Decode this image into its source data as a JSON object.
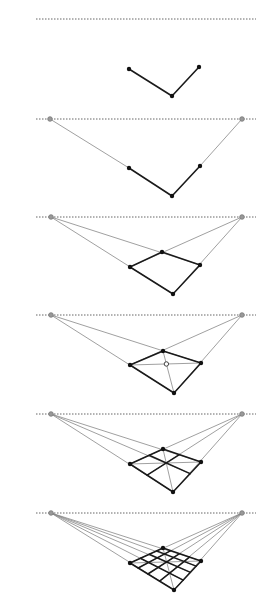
{
  "colors": {
    "horizon": "#666666",
    "vp_fill": "#999999",
    "vp_stroke": "#777777",
    "construction": "#888888",
    "edge": "#1a1a1a",
    "point": "#111111"
  },
  "panels": [
    {
      "step": 1,
      "horizon_y": 19,
      "horizon_x": [
        36,
        256
      ],
      "vps": null,
      "top": null,
      "left": [
        129,
        69
      ],
      "right": [
        199,
        67
      ],
      "bottom": [
        172,
        96
      ],
      "show_vp_lines": false,
      "grid": 0,
      "diagonals": false
    },
    {
      "step": 2,
      "horizon_y": 119,
      "horizon_x": [
        36,
        256
      ],
      "vps": [
        [
          50,
          119
        ],
        [
          242,
          119
        ]
      ],
      "top": null,
      "left": [
        129,
        168
      ],
      "right": [
        200,
        166
      ],
      "bottom": [
        172,
        196
      ],
      "show_vp_lines": true,
      "grid": 0,
      "diagonals": false
    },
    {
      "step": 3,
      "horizon_y": 217,
      "horizon_x": [
        36,
        256
      ],
      "vps": [
        [
          51,
          217
        ],
        [
          242,
          217
        ]
      ],
      "top": [
        162,
        252
      ],
      "left": [
        130,
        267
      ],
      "right": [
        200,
        265
      ],
      "bottom": [
        173,
        294
      ],
      "show_vp_lines": true,
      "grid": 1,
      "diagonals": false
    },
    {
      "step": 4,
      "horizon_y": 315,
      "horizon_x": [
        36,
        256
      ],
      "vps": [
        [
          51,
          315
        ],
        [
          242,
          315
        ]
      ],
      "top": [
        163,
        351
      ],
      "left": [
        130,
        365
      ],
      "right": [
        201,
        363
      ],
      "bottom": [
        174,
        393
      ],
      "show_vp_lines": true,
      "grid": 1,
      "diagonals": true,
      "center_marker": true
    },
    {
      "step": 5,
      "horizon_y": 414,
      "horizon_x": [
        36,
        256
      ],
      "vps": [
        [
          51,
          414
        ],
        [
          242,
          414
        ]
      ],
      "top": [
        163,
        449
      ],
      "left": [
        130,
        464
      ],
      "right": [
        201,
        462
      ],
      "bottom": [
        173,
        492
      ],
      "show_vp_lines": true,
      "grid": 2,
      "diagonals": true
    },
    {
      "step": 6,
      "horizon_y": 513,
      "horizon_x": [
        36,
        256
      ],
      "vps": [
        [
          51,
          513
        ],
        [
          242,
          513
        ]
      ],
      "top": [
        163,
        548
      ],
      "left": [
        130,
        563
      ],
      "right": [
        201,
        561
      ],
      "bottom": [
        174,
        590
      ],
      "show_vp_lines": true,
      "grid": 4,
      "diagonals": true
    }
  ]
}
